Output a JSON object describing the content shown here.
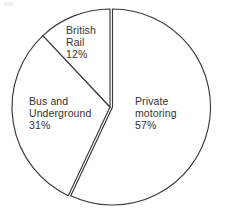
{
  "chart_data": {
    "type": "pie",
    "title": "",
    "subtitle": "",
    "xlabel": "",
    "ylabel": "",
    "grid": false,
    "legend_position": "none",
    "labels_inside": true,
    "total_percent": 100,
    "slices": [
      {
        "name": "private-motoring",
        "label_lines": [
          "Private",
          "motoring"
        ],
        "value": 57,
        "value_label": "57%",
        "start_angle_deg": 0,
        "end_angle_deg": 205.2,
        "exploded": false,
        "fill": "#ffffff",
        "stroke": "#3a3a3a"
      },
      {
        "name": "bus-and-underground",
        "label_lines": [
          "Bus and",
          "Underground"
        ],
        "value": 31,
        "value_label": "31%",
        "start_angle_deg": 205.2,
        "end_angle_deg": 316.8,
        "exploded": true,
        "fill": "#ffffff",
        "stroke": "#3a3a3a"
      },
      {
        "name": "british-rail",
        "label_lines": [
          "British",
          "Rail"
        ],
        "value": 12,
        "value_label": "12%",
        "start_angle_deg": 316.8,
        "end_angle_deg": 360,
        "exploded": true,
        "fill": "#ffffff",
        "stroke": "#3a3a3a"
      }
    ],
    "categories": [
      "Private motoring",
      "Bus and Underground",
      "British Rail"
    ],
    "values": [
      57,
      31,
      12
    ]
  },
  "geometry": {
    "center_x": 112.5,
    "center_y": 107,
    "radius": 98,
    "explode_offset_x": -2.5,
    "explode_offset_y": 0
  },
  "labels": {
    "british_rail": {
      "line1": "British",
      "line2": "Rail",
      "percent": "12%"
    },
    "bus_underground": {
      "line1": "Bus and",
      "line2": "Underground",
      "percent": "31%"
    },
    "private_motoring": {
      "line1": "Private",
      "line2": "motoring",
      "percent": "57%"
    }
  },
  "colors": {
    "background": "#ffffff",
    "outline": "#3a3a3a",
    "text": "#333333"
  }
}
